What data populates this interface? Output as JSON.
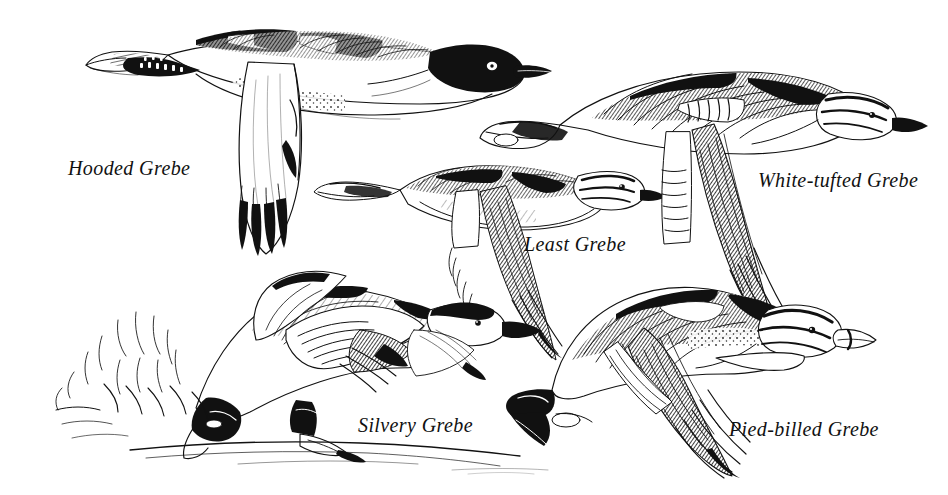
{
  "plate": {
    "kind": "field-guide-illustration-plate",
    "subject": "Grebes in flight",
    "style": "pen-and-ink line engraving",
    "background_color": "#ffffff",
    "ink_color": "#111111",
    "width": 948,
    "height": 495
  },
  "species": [
    {
      "id": "hooded-grebe",
      "label": "Hooded Grebe",
      "position": "upper-left",
      "pose": "level flight, facing right",
      "notes": "pale body, large white underwing with black primary tips, solid black head with white eye patch"
    },
    {
      "id": "least-grebe",
      "label": "Least Grebe",
      "position": "center",
      "pose": "level flight, facing right",
      "notes": "smallest bird, dark mottled back, striped face, pale wing panel"
    },
    {
      "id": "white-tufted-grebe",
      "label": "White-tufted Grebe",
      "position": "upper-right",
      "pose": "level flight, facing right, wing raised",
      "notes": "heavily hatched dark upperparts, long dark wing sweeping down, striped head"
    },
    {
      "id": "silvery-grebe",
      "label": "Silvery Grebe",
      "position": "lower-left",
      "pose": "taking off from water surface, feet pattering",
      "notes": "pale silvery plumage, dark cap, splash of water behind, waterline beneath"
    },
    {
      "id": "pied-billed-grebe",
      "label": "Pied-billed Grebe",
      "position": "lower-right",
      "pose": "flight with downstroke wing, facing right",
      "notes": "stocky, dark mottled back, thick pale bill, bold striped head, trailing feet"
    }
  ],
  "scene_elements": {
    "waterline_label": "water surface line",
    "splash_label": "water splash"
  }
}
